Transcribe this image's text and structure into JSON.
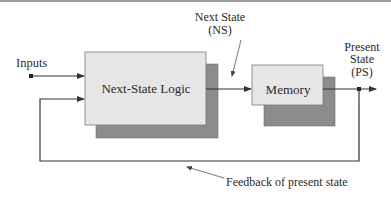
{
  "diagram": {
    "blocks": {
      "next_state_logic": {
        "label": "Next-State Logic"
      },
      "memory": {
        "label": "Memory"
      }
    },
    "labels": {
      "inputs": "Inputs",
      "next_state_line1": "Next State",
      "next_state_line2": "(NS)",
      "present_state_line1": "Present",
      "present_state_line2": "State",
      "present_state_line3": "(PS)",
      "feedback": "Feedback of present state"
    },
    "colors": {
      "block_fill": "#e6e6e6",
      "shadow_fill": "#8c8c8c",
      "line": "#333333",
      "border": "#7a7a7a"
    }
  }
}
